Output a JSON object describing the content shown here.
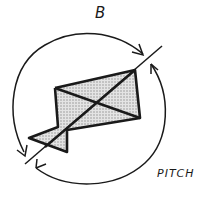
{
  "diagram": {
    "title_label": "B",
    "rotation_label": "PITCH",
    "shape": "kite-shaped body with diagonal cross braces",
    "axis": "diagonal line through body",
    "arrows": [
      "top arc arrow clockwise toward upper-right",
      "bottom arc arrow clockwise toward lower-left"
    ],
    "colors": {
      "stroke": "#1a1a1a",
      "fill_shading": "#c8c8c8",
      "background": "#ffffff"
    }
  }
}
